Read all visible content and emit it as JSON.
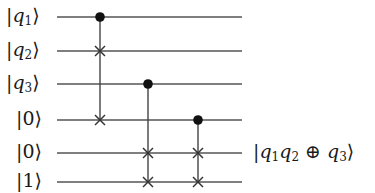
{
  "diagram": {
    "type": "quantum-circuit",
    "wires": [
      {
        "label": "|q1⟩",
        "ket_content": "q",
        "subscript": "1",
        "italic": true,
        "y": 17
      },
      {
        "label": "|q2⟩",
        "ket_content": "q",
        "subscript": "2",
        "italic": true,
        "y": 51
      },
      {
        "label": "|q3⟩",
        "ket_content": "q",
        "subscript": "3",
        "italic": true,
        "y": 84
      },
      {
        "label": "|0⟩",
        "ket_content": "0",
        "subscript": "",
        "italic": false,
        "y": 120
      },
      {
        "label": "|0⟩",
        "ket_content": "0",
        "subscript": "",
        "italic": false,
        "y": 153
      },
      {
        "label": "|1⟩",
        "ket_content": "1",
        "subscript": "",
        "italic": false,
        "y": 182
      }
    ],
    "wire_x_start": 57,
    "wire_x_end": 242,
    "gates": [
      {
        "name": "controlled-swap",
        "x": 100,
        "control_wire": 0,
        "targets": [
          1,
          3
        ]
      },
      {
        "name": "controlled-swap",
        "x": 148,
        "control_wire": 2,
        "targets": [
          4,
          5
        ]
      },
      {
        "name": "controlled-swap",
        "x": 198,
        "control_wire": 3,
        "targets": [
          4,
          5
        ]
      }
    ],
    "output": {
      "label": "|q1q2 ⊕ q3⟩",
      "parts": {
        "a": "q",
        "a_sub": "1",
        "b": "q",
        "b_sub": "2",
        "op": "⊕",
        "c": "q",
        "c_sub": "3"
      },
      "aligned_wire": 4
    },
    "colors": {
      "wire": "#555555",
      "control": "#111111",
      "text": "#1a1a1a"
    }
  }
}
